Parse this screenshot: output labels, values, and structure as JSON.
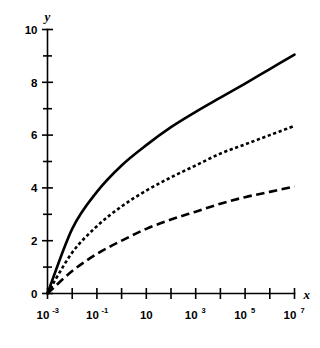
{
  "chart_data": {
    "type": "line",
    "title": "",
    "subtitle": "",
    "xlabel": "x",
    "ylabel": "y",
    "xscale": "log",
    "yscale": "linear",
    "xlim": [
      0.001,
      10000000
    ],
    "ylim": [
      0,
      10
    ],
    "grid": false,
    "legend": null,
    "x_tick_labels": [
      {
        "value": 0.001,
        "mantissa": "10",
        "exponent": "-3",
        "text": "10^-3"
      },
      {
        "value": 0.1,
        "mantissa": "10",
        "exponent": "-1",
        "text": "10^-1"
      },
      {
        "value": 10,
        "mantissa": "10",
        "exponent": "",
        "text": "10"
      },
      {
        "value": 1000,
        "mantissa": "10",
        "exponent": "3",
        "text": "10^3"
      },
      {
        "value": 100000,
        "mantissa": "10",
        "exponent": "5",
        "text": "10^5"
      },
      {
        "value": 10000000,
        "mantissa": "10",
        "exponent": "7",
        "text": "10^7"
      }
    ],
    "x_tick_decades": [
      -3,
      -2,
      -1,
      0,
      1,
      2,
      3,
      4,
      5,
      6,
      7
    ],
    "y_tick_labels": [
      {
        "value": 0,
        "text": "0"
      },
      {
        "value": 2,
        "text": "2"
      },
      {
        "value": 4,
        "text": "4"
      },
      {
        "value": 6,
        "text": "6"
      },
      {
        "value": 8,
        "text": "8"
      },
      {
        "value": 10,
        "text": "10"
      }
    ],
    "y_ticks_minor": [
      1,
      3,
      5,
      7,
      9
    ],
    "x": [
      0.001,
      0.01,
      0.1,
      1,
      10,
      100,
      1000,
      10000,
      100000,
      1000000,
      10000000
    ],
    "series": [
      {
        "name": "upper-curve",
        "style": "solid",
        "color": "#000000",
        "values": [
          0.0,
          2.45,
          3.85,
          4.85,
          5.62,
          6.3,
          6.88,
          7.42,
          7.95,
          8.5,
          9.05
        ]
      },
      {
        "name": "middle-curve",
        "style": "dotted",
        "color": "#000000",
        "values": [
          0.0,
          1.55,
          2.55,
          3.3,
          3.9,
          4.4,
          4.85,
          5.3,
          5.65,
          6.0,
          6.35
        ]
      },
      {
        "name": "lower-curve",
        "style": "dashed",
        "color": "#000000",
        "values": [
          0.0,
          0.85,
          1.5,
          2.0,
          2.45,
          2.8,
          3.1,
          3.4,
          3.65,
          3.85,
          4.05
        ]
      }
    ]
  },
  "axis_labels": {
    "x": "x",
    "y": "y"
  }
}
